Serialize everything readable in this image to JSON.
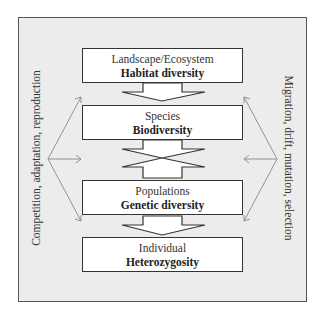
{
  "diagram": {
    "levels": [
      {
        "level": "Landscape/Ecosystem",
        "diversity": "Habitat diversity"
      },
      {
        "level": "Species",
        "diversity": "Biodiversity"
      },
      {
        "level": "Populations",
        "diversity": "Genetic diversity"
      },
      {
        "level": "Individual",
        "diversity": "Heterozygosity"
      }
    ],
    "left_label": "Competition, adaptation, reproduction",
    "right_label": "Migration, drift, mutation, selection",
    "connectors": [
      {
        "from": "Landscape/Ecosystem",
        "to": "Species",
        "type": "down-arrow"
      },
      {
        "from": "Species",
        "to": "Populations",
        "type": "bidirectional-arrow"
      },
      {
        "from": "Populations",
        "to": "Individual",
        "type": "down-arrow"
      }
    ],
    "colors": {
      "frame_bg": "#ececec",
      "frame_border": "#555555",
      "box_bg": "#ffffff",
      "side_arrows": "#888888"
    }
  }
}
